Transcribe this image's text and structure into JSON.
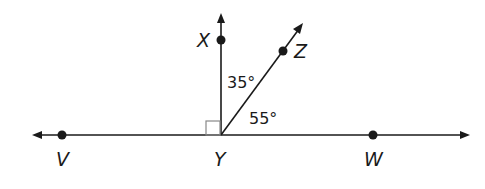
{
  "diagram": {
    "points": {
      "V": {
        "label": "V"
      },
      "Y": {
        "label": "Y"
      },
      "W": {
        "label": "W"
      },
      "X": {
        "label": "X"
      },
      "Z": {
        "label": "Z"
      }
    },
    "angles": {
      "XYZ": "35°",
      "ZYW": "55°"
    },
    "right_angle_at": "Y",
    "colors": {
      "line": "#1a1a1a",
      "right_angle_mark": "#888888"
    }
  }
}
